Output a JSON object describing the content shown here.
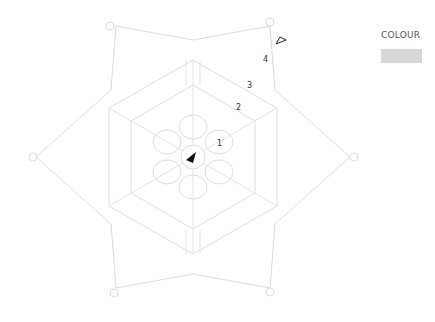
{
  "legend": {
    "title": "COLOUR",
    "swatch_color": "#d6d6d6"
  },
  "diagram": {
    "type": "crochet-motif-chart",
    "shape": "six-pointed hexagonal motif",
    "line_color": "#d9d9d9",
    "row_labels": [
      "1",
      "2",
      "3",
      "4"
    ],
    "start_marker": "filled-triangle",
    "end_marker": "open-triangle"
  }
}
